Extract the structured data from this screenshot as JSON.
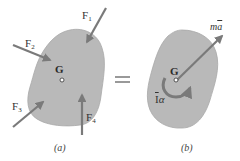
{
  "figure": {
    "equals_sign": "=",
    "colors": {
      "body_fill": "#b9b9b9",
      "body_stroke": "#a8a8a8",
      "arrow": "#7a7a7a",
      "text": "#333333",
      "background": "#ffffff"
    },
    "panel_a": {
      "caption": "(a)",
      "center_label": "G",
      "forces": [
        {
          "name": "F",
          "sub": "1"
        },
        {
          "name": "F",
          "sub": "2"
        },
        {
          "name": "F",
          "sub": "3"
        },
        {
          "name": "F",
          "sub": "4"
        }
      ]
    },
    "panel_b": {
      "caption": "(b)",
      "center_label": "G",
      "linear_term": {
        "base": "m",
        "accent_var": "a"
      },
      "angular_term": {
        "inertia": "I",
        "accel": "α"
      }
    }
  }
}
